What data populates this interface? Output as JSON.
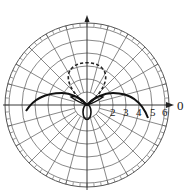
{
  "chart_data": {
    "type": "polar",
    "title": "",
    "center_px": [
      87,
      105
    ],
    "px_per_unit": 13,
    "outer_radius_px": 82,
    "radial_rings": [
      1,
      2,
      3,
      4,
      5,
      6
    ],
    "radial_tick_labels": [
      "2",
      "3",
      "4",
      "5",
      "6"
    ],
    "angular_zero_label": "0",
    "angular_grid_step_deg": 15,
    "minor_tick_step_deg": 5,
    "series": [
      {
        "name": "solid pattern",
        "style": "solid",
        "description": "Broad wide lobes spreading left and right with peak near r≈5 at ~±160°/~20° above horizontal, dipping to origin, plus small rear lobe below origin",
        "approx_points_deg_r": [
          [
            -15,
            4.7
          ],
          [
            0,
            4.4
          ],
          [
            15,
            4.0
          ],
          [
            30,
            2.6
          ],
          [
            45,
            1.0
          ],
          [
            90,
            0.2
          ],
          [
            135,
            1.0
          ],
          [
            150,
            2.6
          ],
          [
            165,
            4.0
          ],
          [
            180,
            4.4
          ],
          [
            195,
            4.7
          ]
        ],
        "rear_lobe": {
          "angle_deg": 270,
          "r": 1.2
        }
      },
      {
        "name": "dashed pattern",
        "style": "dashed",
        "description": "Circular lobe pointing upward (90°) with max r≈3.2",
        "approx_points_deg_r": [
          [
            30,
            1.6
          ],
          [
            45,
            2.3
          ],
          [
            60,
            2.8
          ],
          [
            75,
            3.1
          ],
          [
            90,
            3.2
          ],
          [
            105,
            3.1
          ],
          [
            120,
            2.8
          ],
          [
            135,
            2.3
          ],
          [
            150,
            1.6
          ]
        ]
      }
    ],
    "grid": true,
    "legend": null
  },
  "labels": {
    "r2": "2",
    "r3": "3",
    "r4": "4",
    "r5": "5",
    "r6": "6",
    "zero": "0"
  }
}
